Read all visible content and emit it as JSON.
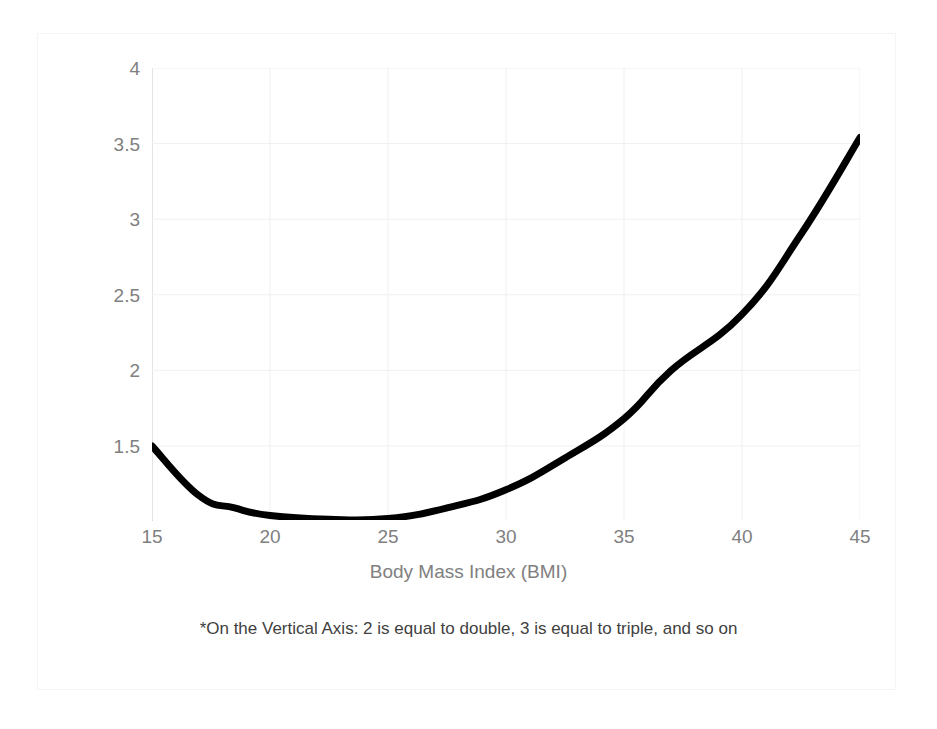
{
  "figure": {
    "background": "#ffffff",
    "frame_color": "#f4f4f4",
    "line_color": "#000000",
    "grid_color": "#f0f0f0",
    "axis_color": "#d9d9d9",
    "tick_label_color": "#808080",
    "footnote": "*On the Vertical Axis: 2 is equal to double, 3 is equal to triple, and so on"
  },
  "chart_data": {
    "type": "line",
    "title": "",
    "xlabel": "Body Mass Index (BMI)",
    "ylabel": "*Probability of Death",
    "xlim": [
      15,
      45
    ],
    "ylim": [
      1.01,
      4
    ],
    "xticks": [
      15,
      20,
      25,
      30,
      35,
      40,
      45
    ],
    "xtick_labels": [
      "15",
      "20",
      "25",
      "30",
      "35",
      "40",
      "45"
    ],
    "yticks": [
      1.5,
      2,
      2.5,
      3,
      3.5,
      4
    ],
    "ytick_labels": [
      "1.5",
      "2",
      "2.5",
      "3",
      "3.5",
      "4"
    ],
    "grid": true,
    "legend": "none",
    "series": [
      {
        "name": "Probability of Death",
        "color": "#000000",
        "line_width": 7,
        "x": [
          15,
          17,
          18.5,
          20,
          22.5,
          25,
          27.5,
          30,
          32.5,
          35,
          37,
          40,
          42.5,
          45
        ],
        "values": [
          1.5,
          1.17,
          1.09,
          1.04,
          1.015,
          1.02,
          1.09,
          1.21,
          1.42,
          1.68,
          2.0,
          2.37,
          2.9,
          3.54
        ]
      }
    ],
    "annotations": [
      "*On the Vertical Axis: 2 is equal to double, 3 is equal to triple, and so on"
    ]
  }
}
